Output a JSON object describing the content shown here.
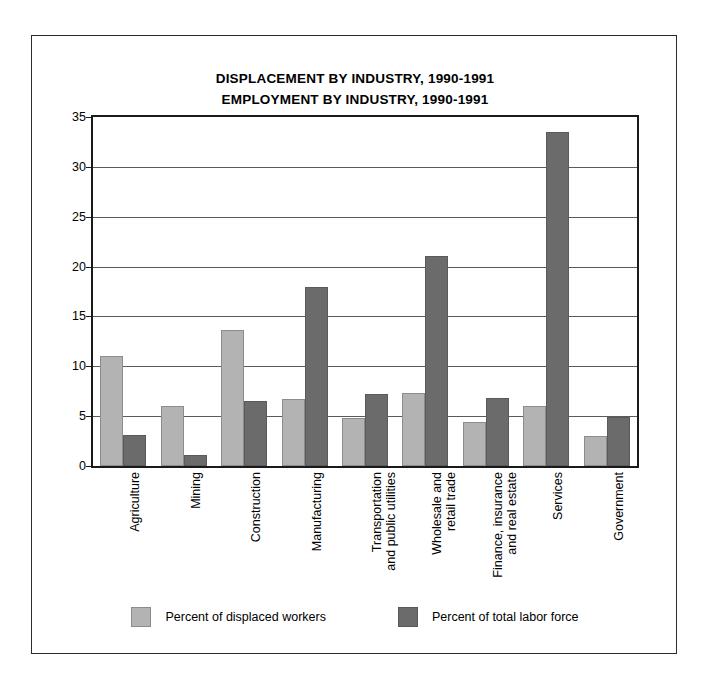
{
  "chart_data": {
    "type": "bar",
    "title": "DISPLACEMENT BY INDUSTRY, 1990-1991",
    "subtitle": "EMPLOYMENT BY INDUSTRY, 1990-1991",
    "xlabel": "",
    "ylabel": "",
    "ylim": [
      0,
      35
    ],
    "yticks": [
      0,
      5,
      10,
      15,
      20,
      25,
      30,
      35
    ],
    "grid": true,
    "legend_position": "bottom",
    "categories": [
      "Agriculture",
      "Mining",
      "Construction",
      "Manufacturing",
      "Transportation\nand public utilities",
      "Wholesale and\nretail trade",
      "Finance, insurance\nand real estate",
      "Services",
      "Government"
    ],
    "series": [
      {
        "name": "Percent of displaced workers",
        "color": "#b3b3b3",
        "values": [
          11.0,
          6.0,
          13.6,
          6.7,
          4.8,
          7.3,
          4.4,
          6.0,
          3.0
        ]
      },
      {
        "name": "Percent of total labor force",
        "color": "#6b6b6b",
        "values": [
          3.1,
          1.1,
          6.5,
          18.0,
          7.2,
          21.1,
          6.8,
          33.5,
          4.9
        ]
      }
    ]
  },
  "legend": {
    "items": [
      {
        "label": "Percent of displaced workers",
        "swatch": "light"
      },
      {
        "label": "Percent of total labor force",
        "swatch": "dark"
      }
    ]
  }
}
